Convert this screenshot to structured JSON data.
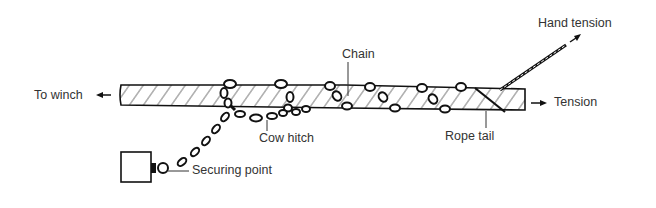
{
  "diagram": {
    "type": "rope-chain-stopper",
    "labels": {
      "to_winch": "To winch",
      "chain": "Chain",
      "cow_hitch": "Cow hitch",
      "securing_point": "Securing point",
      "rope_tail": "Rope tail",
      "tension": "Tension",
      "hand_tension": "Hand tension"
    },
    "colors": {
      "ink": "#111111",
      "text": "#333333",
      "background": "#ffffff"
    }
  }
}
